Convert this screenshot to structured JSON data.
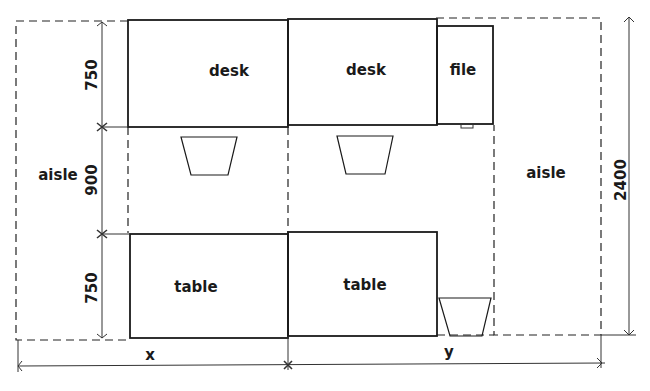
{
  "diagram": {
    "type": "office-layout-plan",
    "furniture": {
      "desk_left": "desk",
      "desk_right": "desk",
      "file": "file",
      "table_left": "table",
      "table_right": "table"
    },
    "zones": {
      "aisle_left": "aisle",
      "aisle_right": "aisle"
    },
    "dimensions": {
      "top_depth": "750",
      "middle_gap": "900",
      "bottom_depth": "750",
      "total_depth": "2400",
      "width_x": "x",
      "width_y": "y"
    },
    "colors": {
      "line": "#1a1a1a",
      "background": "#ffffff"
    }
  }
}
